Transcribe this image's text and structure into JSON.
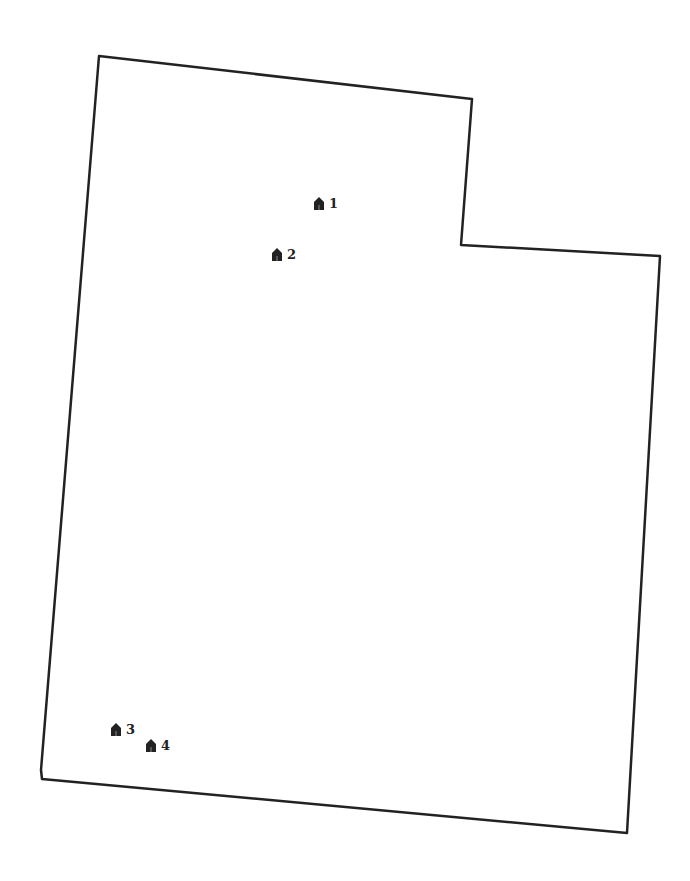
{
  "map": {
    "outline_color": "#222222",
    "outline_points": [
      [
        99,
        56
      ],
      [
        472,
        99
      ],
      [
        461,
        245
      ],
      [
        660,
        256
      ],
      [
        627,
        833
      ],
      [
        42,
        779
      ],
      [
        41,
        770
      ]
    ],
    "markers": [
      {
        "id": 1,
        "label": "1",
        "x": 313,
        "y": 196,
        "icon": "house-icon"
      },
      {
        "id": 2,
        "label": "2",
        "x": 271,
        "y": 247,
        "icon": "house-icon"
      },
      {
        "id": 3,
        "label": "3",
        "x": 110,
        "y": 722,
        "icon": "house-icon"
      },
      {
        "id": 4,
        "label": "4",
        "x": 145,
        "y": 738,
        "icon": "house-icon"
      }
    ]
  }
}
